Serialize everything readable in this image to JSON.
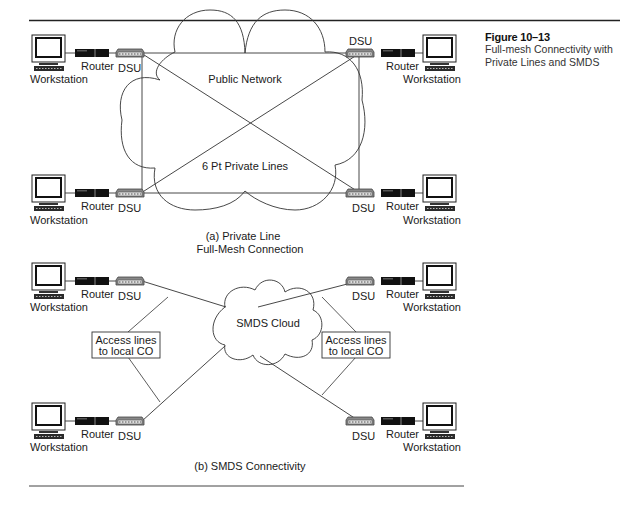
{
  "figure": {
    "number": "Figure 10–13",
    "title_line1": "Full-mesh Connectivity with",
    "title_line2": "Private Lines and SMDS"
  },
  "part_a": {
    "caption_line1": "(a) Private Line",
    "caption_line2": "Full-Mesh Connection",
    "cloud_label": "Public Network",
    "lines_label": "6 Pt Private Lines",
    "nodes": [
      {
        "position": "top-left",
        "workstation": "Workstation",
        "router": "Router",
        "dsu": "DSU"
      },
      {
        "position": "top-right",
        "workstation": "Workstation",
        "router": "Router",
        "dsu": "DSU"
      },
      {
        "position": "bottom-left",
        "workstation": "Workstation",
        "router": "Router",
        "dsu": "DSU"
      },
      {
        "position": "bottom-right",
        "workstation": "Workstation",
        "router": "Router",
        "dsu": "DSU"
      }
    ]
  },
  "part_b": {
    "caption": "(b) SMDS Connectivity",
    "cloud_label": "SMDS Cloud",
    "access_left_line1": "Access lines",
    "access_left_line2": "to local CO",
    "access_right_line1": "Access lines",
    "access_right_line2": "to local CO",
    "nodes": [
      {
        "position": "top-left",
        "workstation": "Workstation",
        "router": "Router",
        "dsu": "DSU"
      },
      {
        "position": "top-right",
        "workstation": "Workstation",
        "router": "Router",
        "dsu": "DSU"
      },
      {
        "position": "bottom-left",
        "workstation": "Workstation",
        "router": "Router",
        "dsu": "DSU"
      },
      {
        "position": "bottom-right",
        "workstation": "Workstation",
        "router": "Router",
        "dsu": "DSU"
      }
    ]
  }
}
